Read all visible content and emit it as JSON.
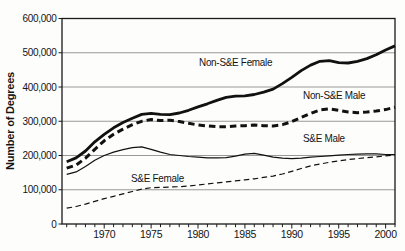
{
  "chart_data": {
    "type": "line",
    "title": "",
    "xlabel": "",
    "ylabel": "Number of Degrees",
    "xlim": [
      1966,
      2001
    ],
    "ylim": [
      0,
      600000
    ],
    "grid": true,
    "grid_color": "#999999",
    "axis_color": "#1a1a1a",
    "line_color": "#111111",
    "legend_position": "inline-labels",
    "y_ticks": [
      "0",
      "100,000",
      "200,000",
      "300,000",
      "400,000",
      "500,000",
      "600,000"
    ],
    "x_ticks": [
      "1970",
      "1975",
      "1980",
      "1985",
      "1990",
      "1995",
      "2000"
    ],
    "x_minor_tick_interval_years": 1,
    "x": [
      1966,
      1967,
      1968,
      1969,
      1970,
      1971,
      1972,
      1973,
      1974,
      1975,
      1976,
      1977,
      1978,
      1979,
      1980,
      1981,
      1982,
      1983,
      1984,
      1985,
      1986,
      1987,
      1988,
      1989,
      1990,
      1991,
      1992,
      1993,
      1994,
      1995,
      1996,
      1997,
      1998,
      1999,
      2000,
      2001
    ],
    "series": [
      {
        "name": "Non-S&E Female",
        "line_style": "thick-solid",
        "color": "#111111",
        "values": [
          182000,
          193000,
          213000,
          240000,
          262000,
          281000,
          296000,
          309000,
          320000,
          323000,
          320000,
          319000,
          324000,
          332000,
          342000,
          351000,
          361000,
          370000,
          373000,
          374000,
          378000,
          385000,
          394000,
          410000,
          428000,
          448000,
          464000,
          475000,
          477000,
          471000,
          470000,
          475000,
          483000,
          494000,
          508000,
          520000
        ]
      },
      {
        "name": "Non-S&E Male",
        "line_style": "thick-dashed",
        "color": "#111111",
        "values": [
          163000,
          172000,
          192000,
          218000,
          243000,
          262000,
          277000,
          290000,
          300000,
          305000,
          302000,
          303000,
          299000,
          294000,
          289000,
          286000,
          284000,
          284000,
          286000,
          287000,
          289000,
          287000,
          286000,
          290000,
          299000,
          311000,
          323000,
          333000,
          336000,
          332000,
          327000,
          325000,
          327000,
          330000,
          334000,
          341000
        ]
      },
      {
        "name": "S&E Male",
        "line_style": "thin-solid",
        "color": "#111111",
        "values": [
          145000,
          152000,
          168000,
          186000,
          200000,
          210000,
          217000,
          223000,
          225000,
          218000,
          210000,
          203000,
          200000,
          197000,
          195000,
          193000,
          193000,
          194000,
          198000,
          204000,
          206000,
          201000,
          195000,
          192000,
          191000,
          192000,
          195000,
          197000,
          199000,
          201000,
          203000,
          204000,
          205000,
          205000,
          203000,
          203000
        ]
      },
      {
        "name": "S&E Female",
        "line_style": "thin-dashed",
        "color": "#111111",
        "values": [
          46000,
          51000,
          58000,
          66000,
          74000,
          81000,
          88000,
          95000,
          102000,
          106000,
          107000,
          108000,
          109000,
          111000,
          114000,
          117000,
          120000,
          123000,
          126000,
          129000,
          132000,
          136000,
          140000,
          146000,
          154000,
          162000,
          170000,
          175000,
          180000,
          184000,
          188000,
          191000,
          194000,
          196000,
          199000,
          201000
        ]
      }
    ]
  }
}
